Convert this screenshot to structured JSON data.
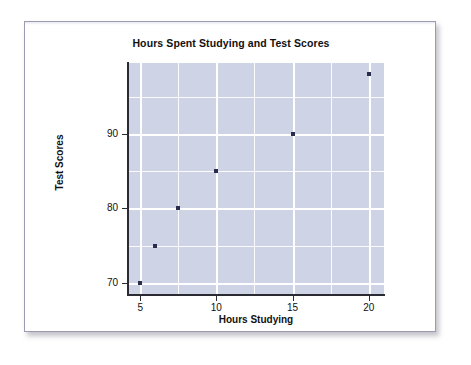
{
  "chart_data": {
    "type": "scatter",
    "title": "Hours Spent Studying and Test Scores",
    "xlabel": "Hours Studying",
    "ylabel": "Test Scores",
    "xlim": [
      4.2,
      21.0
    ],
    "ylim": [
      68.5,
      99.5
    ],
    "xticks": [
      5,
      10,
      15,
      20
    ],
    "yticks": [
      70,
      80,
      90
    ],
    "xtick_labels": [
      "5",
      "10",
      "15",
      "20"
    ],
    "ytick_labels": [
      "70",
      "80",
      "90"
    ],
    "x_gridlines": [
      5,
      7.5,
      10,
      12.5,
      15,
      17.5,
      20
    ],
    "y_gridlines": [
      70,
      75,
      80,
      85,
      90,
      95
    ],
    "grid": true,
    "legend": null,
    "marker_color": "#2a2c4e",
    "plot_background": "#ced3e6",
    "gridline_color": "#ffffff",
    "points": [
      {
        "x": 5,
        "y": 70
      },
      {
        "x": 6,
        "y": 75
      },
      {
        "x": 7.5,
        "y": 80
      },
      {
        "x": 10,
        "y": 85
      },
      {
        "x": 15,
        "y": 90
      },
      {
        "x": 20,
        "y": 98
      }
    ],
    "series": [
      {
        "name": "Test Scores",
        "x": [
          5,
          6,
          7.5,
          10,
          15,
          20
        ],
        "values": [
          70,
          75,
          80,
          85,
          90,
          98
        ]
      }
    ]
  }
}
